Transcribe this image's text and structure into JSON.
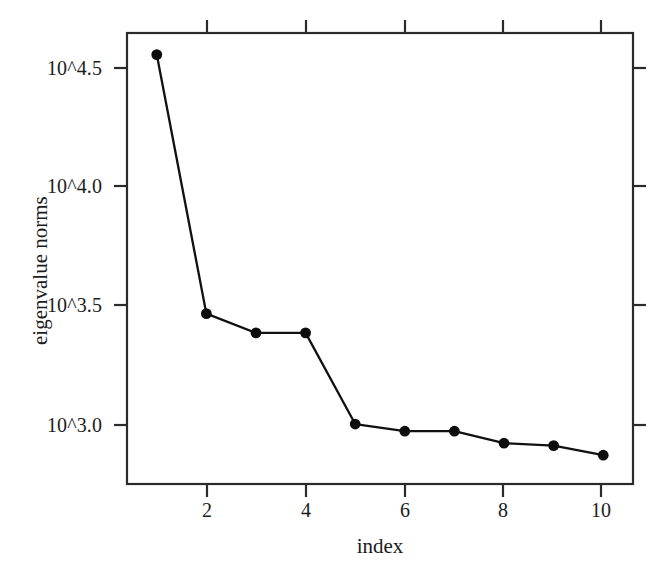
{
  "chart_data": {
    "type": "line",
    "title": "",
    "subtitle": "",
    "xlabel": "index",
    "ylabel": "eigenvalue norms",
    "x": [
      1,
      2,
      3,
      4,
      5,
      6,
      7,
      8,
      9,
      10
    ],
    "values_log10": [
      4.54,
      3.46,
      3.38,
      3.38,
      3.0,
      2.97,
      2.97,
      2.92,
      2.91,
      2.87
    ],
    "series": [
      {
        "name": "eigenvalue norms",
        "values": [
          4.54,
          3.46,
          3.38,
          3.38,
          3.0,
          2.97,
          2.97,
          2.92,
          2.91,
          2.87
        ]
      }
    ],
    "xlim": [
      0.4,
      10.6
    ],
    "ylim_log10": [
      2.75,
      4.63
    ],
    "xticks": [
      2,
      4,
      6,
      8,
      10
    ],
    "xtick_labels": [
      "2",
      "4",
      "6",
      "8",
      "10"
    ],
    "yticks_log10": [
      3.0,
      3.5,
      4.0,
      4.5
    ],
    "ytick_labels": [
      "10^3.0",
      "10^3.5",
      "10^4.0",
      "10^4.5"
    ],
    "grid": false,
    "legend": false,
    "legend_position": "none",
    "marker": "filled-circle",
    "line_color": "#111111",
    "marker_color": "#0d0d0d",
    "axis_color": "#2b2b2b",
    "background_color": "#ffffff"
  },
  "axes": {
    "y_title": "eigenvalue norms",
    "x_title": "index",
    "y_tick_labels": [
      "10^4.5",
      "10^4.0",
      "10^3.5",
      "10^3.0"
    ],
    "x_tick_labels": [
      "2",
      "4",
      "6",
      "8",
      "10"
    ]
  }
}
